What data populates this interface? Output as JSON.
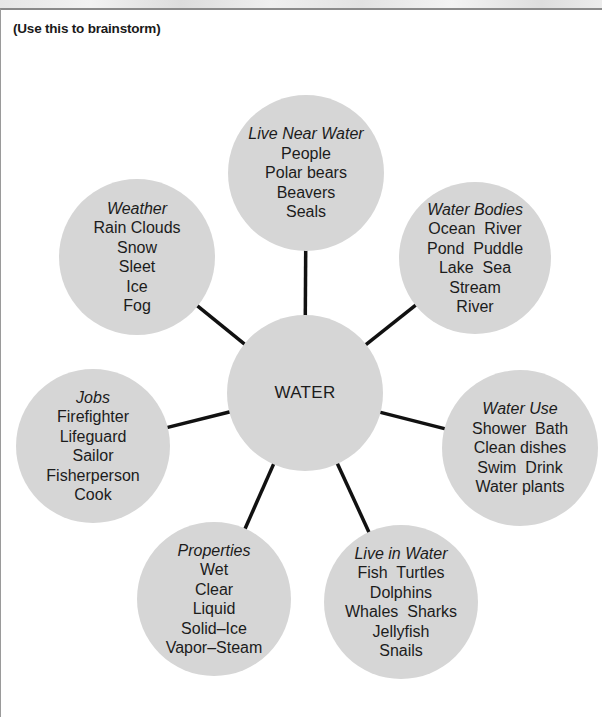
{
  "page": {
    "instructions": "(Use this to brainstorm)"
  },
  "diagram": {
    "type": "word-web",
    "center": {
      "label": "WATER",
      "x": 305,
      "y": 393,
      "r": 78
    },
    "nodes": [
      {
        "id": "live-near-water",
        "title": "Live Near Water",
        "items": [
          "People",
          "Polar bears",
          "Beavers",
          "Seals"
        ],
        "x": 306,
        "y": 173,
        "r": 78
      },
      {
        "id": "water-bodies",
        "title": "Water Bodies",
        "items": [
          "Ocean  River",
          "Pond  Puddle",
          "Lake  Sea",
          "Stream",
          "River"
        ],
        "x": 475,
        "y": 258,
        "r": 76
      },
      {
        "id": "water-use",
        "title": "Water Use",
        "items": [
          "Shower  Bath",
          "Clean dishes",
          "Swim  Drink",
          "Water plants"
        ],
        "x": 520,
        "y": 448,
        "r": 78
      },
      {
        "id": "live-in-water",
        "title": "Live in Water",
        "items": [
          "Fish  Turtles",
          "Dolphins",
          "Whales  Sharks",
          "Jellyfish",
          "Snails"
        ],
        "x": 401,
        "y": 602,
        "r": 77
      },
      {
        "id": "properties",
        "title": "Properties",
        "items": [
          "Wet",
          "Clear",
          "Liquid",
          "Solid–Ice",
          "Vapor–Steam"
        ],
        "x": 214,
        "y": 599,
        "r": 77
      },
      {
        "id": "jobs",
        "title": "Jobs",
        "items": [
          "Firefighter",
          "Lifeguard",
          "Sailor",
          "Fisherperson",
          "Cook"
        ],
        "x": 93,
        "y": 446,
        "r": 77
      },
      {
        "id": "weather",
        "title": "Weather",
        "items": [
          "Rain Clouds",
          "Snow",
          "Sleet",
          "Ice",
          "Fog"
        ],
        "x": 137,
        "y": 257,
        "r": 78
      }
    ],
    "colors": {
      "node_fill": "#d6d6d6",
      "connector": "#111111",
      "text": "#1c1c1c"
    }
  }
}
